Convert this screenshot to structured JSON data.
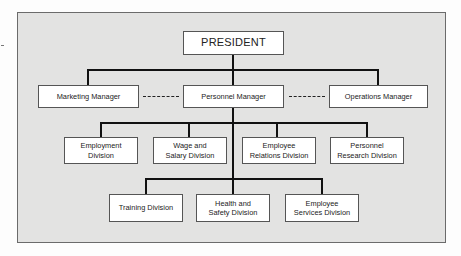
{
  "chart_title": "",
  "colors": {
    "background": "#e3e3e2",
    "box": "#ffffff",
    "line": "#111111",
    "border": "#6b6b6b"
  },
  "top": {
    "label": "PRESIDENT"
  },
  "managers": [
    {
      "label": "Marketing Manager"
    },
    {
      "label": "Personnel Manager"
    },
    {
      "label": "Operations Manager"
    }
  ],
  "divisions_row1": [
    {
      "label": "Employment\nDivision"
    },
    {
      "label": "Wage and\nSalary Division"
    },
    {
      "label": "Employee\nRelations Division"
    },
    {
      "label": "Personnel\nResearch Division"
    }
  ],
  "divisions_row2": [
    {
      "label": "Training Division"
    },
    {
      "label": "Health and\nSafety Division"
    },
    {
      "label": "Employee\nServices Division"
    }
  ]
}
